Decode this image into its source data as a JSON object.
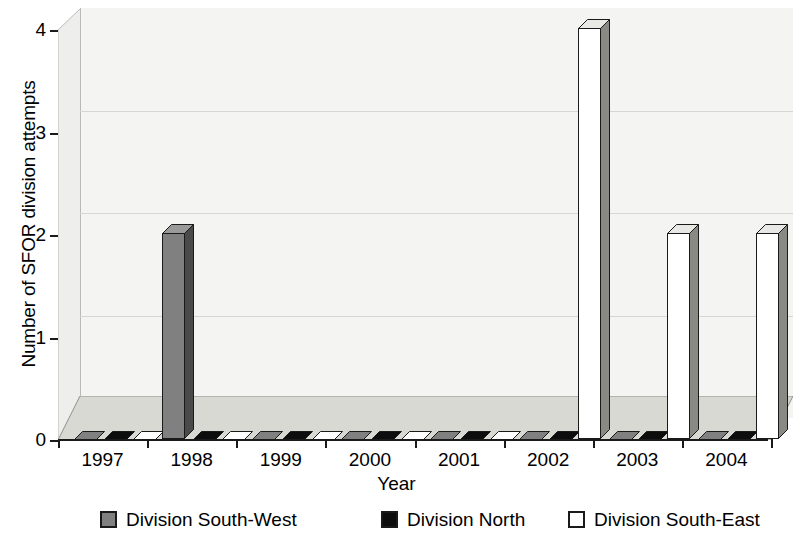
{
  "chart_data": {
    "type": "bar",
    "title": "",
    "subtitle": "",
    "xlabel": "Year",
    "ylabel": "Number of SFOR division attempts",
    "categories": [
      "1997",
      "1998",
      "1999",
      "2000",
      "2001",
      "2002",
      "2003",
      "2004"
    ],
    "series": [
      {
        "name": "Division South-West",
        "color": "#808080",
        "values": [
          0,
          2,
          0,
          0,
          0,
          0,
          0,
          0
        ]
      },
      {
        "name": "Division North",
        "color": "#0d0d0d",
        "values": [
          0,
          0,
          0,
          0,
          0,
          0,
          0,
          0
        ]
      },
      {
        "name": "Division South-East",
        "color": "#ffffff",
        "values": [
          0,
          0,
          0,
          0,
          0,
          4,
          2,
          2
        ]
      }
    ],
    "ylim": [
      0,
      4
    ],
    "yticks": [
      0,
      1,
      2,
      3,
      4
    ],
    "ytick_labels": [
      "0",
      "1",
      "2",
      "3",
      "4"
    ],
    "grid": true,
    "grid_axis": "y",
    "legend_position": "bottom",
    "style": "3d-column",
    "colors": {
      "bar_southwest": "#808080",
      "bar_north": "#0d0d0d",
      "bar_southeast": "#ffffff",
      "bar_outline": "#1a1a1a",
      "wall": "#f4f4f2",
      "floor": "#d9d9d4",
      "gridline": "#d6d6d2",
      "axis": "#1a1a1a"
    }
  },
  "axes": {
    "y_title": "Number of SFOR division attempts",
    "x_title": "Year",
    "y_labels": [
      "0",
      "1",
      "2",
      "3",
      "4"
    ],
    "x_labels": [
      "1997",
      "1998",
      "1999",
      "2000",
      "2001",
      "2002",
      "2003",
      "2004"
    ]
  },
  "legend": {
    "items": [
      {
        "label": "Division South-West",
        "swatch": "#808080"
      },
      {
        "label": "Division North",
        "swatch": "#0d0d0d"
      },
      {
        "label": "Division South-East",
        "swatch": "#ffffff"
      }
    ]
  }
}
